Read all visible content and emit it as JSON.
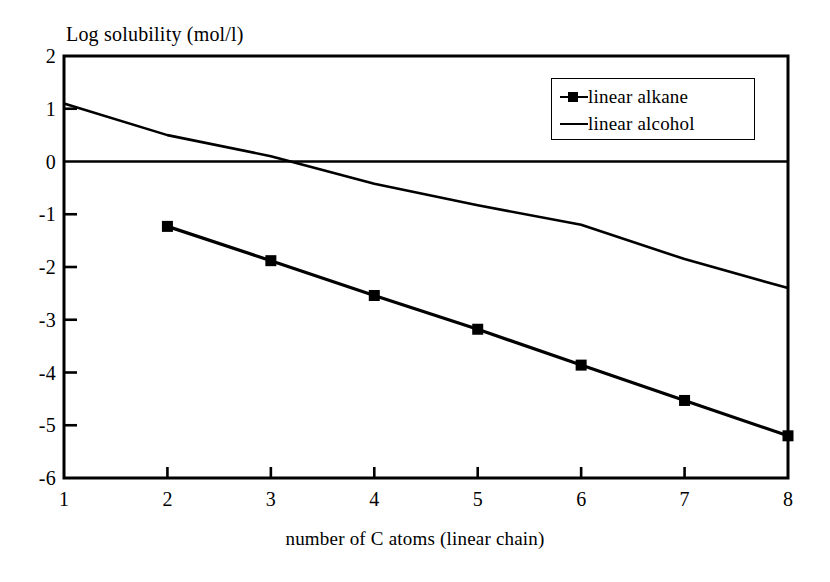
{
  "chart_data": {
    "type": "line",
    "title": "",
    "ylabel": "Log solubility (mol/l)",
    "xlabel": "number of C atoms (linear chain)",
    "xlim": [
      1,
      8
    ],
    "ylim": [
      -6,
      2
    ],
    "grid": false,
    "legend_position": "top-right",
    "x_ticks": [
      "1",
      "2",
      "3",
      "4",
      "5",
      "6",
      "7",
      "8"
    ],
    "y_ticks": [
      "2",
      "1",
      "0",
      "-1",
      "-2",
      "-3",
      "-4",
      "-5",
      "-6"
    ],
    "zero_line": 0,
    "series": [
      {
        "name": "linear alkane",
        "marker": "square",
        "color": "#000000",
        "x": [
          2,
          3,
          4,
          5,
          6,
          7,
          8
        ],
        "values": [
          -1.23,
          -1.88,
          -2.54,
          -3.18,
          -3.86,
          -4.53,
          -5.2
        ]
      },
      {
        "name": "linear alcohol",
        "marker": "none",
        "color": "#000000",
        "x": [
          1,
          2,
          3,
          4,
          5,
          6,
          7,
          8
        ],
        "values": [
          1.1,
          0.5,
          0.1,
          -0.42,
          -0.83,
          -1.2,
          -1.85,
          -2.4
        ]
      }
    ]
  },
  "legend": {
    "items": [
      {
        "label": "linear alkane",
        "key": "line-with-square-marker"
      },
      {
        "label": "linear alcohol",
        "key": "plain-line"
      }
    ]
  }
}
